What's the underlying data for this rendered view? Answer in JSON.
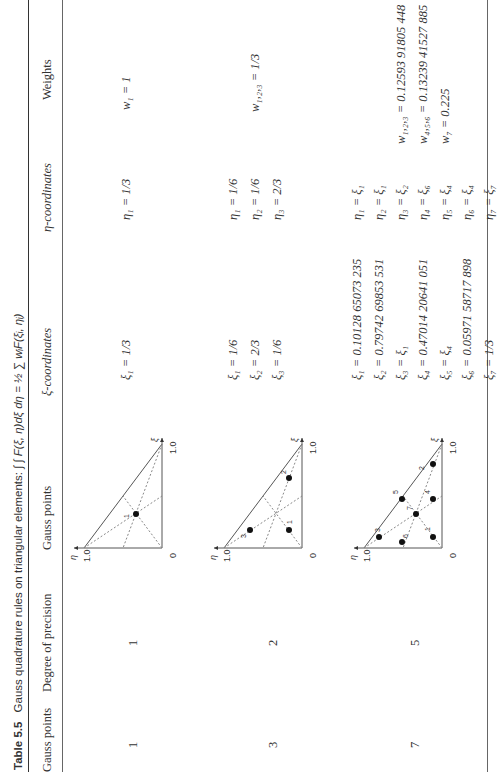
{
  "caption": {
    "label": "Table 5.5",
    "text": "Gauss quadrature rules on triangular elements:",
    "formula": "∫ ∫ F(ξ, η)dξ dη = ½ ∑ wᵢF(ξᵢ, ηᵢ)"
  },
  "headers": {
    "gauss_points": "Gauss points",
    "degree": "Degree of precision",
    "diagram": "Gauss points",
    "xi": "ξ-coordinates",
    "eta": "η-coordinates",
    "weights": "Weights"
  },
  "diagram_labels": {
    "eta_axis": "η",
    "xi_axis": "ξ",
    "one": "1.0",
    "zero": "0"
  },
  "rows": [
    {
      "gauss_points": "1",
      "degree": "1",
      "point_labels": [
        "1"
      ],
      "xi": [
        "ξ₁ = 1/3"
      ],
      "eta": [
        "η₁ = 1/3"
      ],
      "weights": [
        "w₁ = 1"
      ]
    },
    {
      "gauss_points": "3",
      "degree": "2",
      "point_labels": [
        "1",
        "2",
        "3"
      ],
      "xi": [
        "ξ₁ = 1/6",
        "ξ₂ = 2/3",
        "ξ₃ = 1/6"
      ],
      "eta": [
        "η₁ = 1/6",
        "η₂ = 1/6",
        "η₃ = 2/3"
      ],
      "weights": [
        "w₁,₂,₃ = 1/3"
      ]
    },
    {
      "gauss_points": "7",
      "degree": "5",
      "point_labels": [
        "1",
        "2",
        "3",
        "4",
        "5",
        "6",
        "7"
      ],
      "xi": [
        "ξ₁ = 0.10128 65073 235",
        "ξ₂ = 0.79742 69853 531",
        "ξ₃ = ξ₁",
        "ξ₄ = 0.47014 20641 051",
        "ξ₅ = ξ₄",
        "ξ₆ = 0.05971 58717 898",
        "ξ₇ = 1/3"
      ],
      "eta": [
        "η₁ = ξ₁",
        "η₂ = ξ₁",
        "η₃ = ξ₂",
        "η₄ = ξ₆",
        "η₅ = ξ₄",
        "η₆ = ξ₄",
        "η₇ = ξ₇"
      ],
      "weights": [
        "w₁,₂,₃ = 0.12593 91805 448",
        "w₄,₅,₆ = 0.13239 41527 885",
        "w₇ = 0.225"
      ]
    }
  ]
}
